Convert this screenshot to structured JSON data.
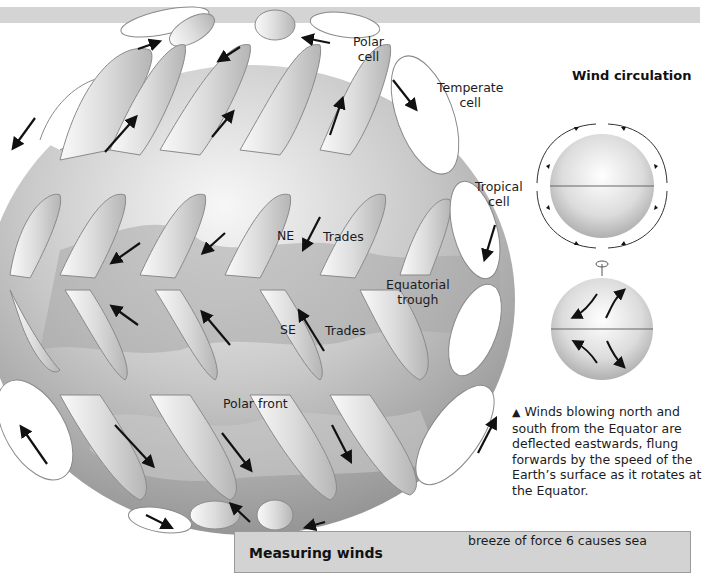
{
  "diagram": {
    "main_globe": {
      "labels": {
        "polar_cell": [
          "Polar",
          "cell"
        ],
        "temperate_cell": [
          "Temperate",
          "cell"
        ],
        "tropical_cell": [
          "Tropical",
          "cell"
        ],
        "ne": "NE",
        "ne_trades": "Trades",
        "se": "SE",
        "se_trades": "Trades",
        "equatorial_trough": [
          "Equatorial",
          "trough"
        ],
        "polar_front": "Polar front"
      }
    },
    "inset": {
      "title": "Wind circulation",
      "caption_marker": "▲",
      "caption": "Winds blowing north and south from the Equator are deflected eastwards, flung forwards by the speed of the Earth’s surface as it rotates at the Equator."
    },
    "info_box": {
      "title": "Measuring winds",
      "text": "breeze of force 6 causes sea"
    },
    "colors": {
      "globe_light": "#f2f2f2",
      "globe_dark": "#9a9a9a",
      "ribbon": "#e6e6e6",
      "box_bg": "#d3d3d3",
      "top_bar": "#d4d4d4"
    }
  }
}
